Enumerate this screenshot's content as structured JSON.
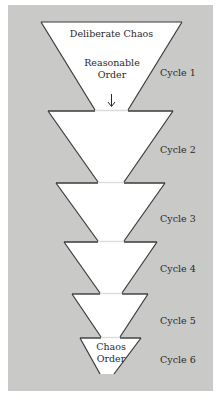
{
  "diagram": {
    "colors": {
      "background": "#c9c9c7",
      "funnel_fill": "#ffffff",
      "outline": "#3a3a3a",
      "connector": "#dcdcdc",
      "text": "#2a2a2a"
    },
    "top_funnel": {
      "top_label": "Deliberate Chaos",
      "middle_label_line1": "Reasonable",
      "middle_label_line2": "Order",
      "arrow": "down-arrow"
    },
    "bottom_funnel": {
      "label_line1": "Chaos",
      "label_line2": "Order"
    },
    "cycles": [
      {
        "label": "Cycle 1"
      },
      {
        "label": "Cycle 2"
      },
      {
        "label": "Cycle 3"
      },
      {
        "label": "Cycle 4"
      },
      {
        "label": "Cycle 5"
      },
      {
        "label": "Cycle 6"
      }
    ]
  }
}
